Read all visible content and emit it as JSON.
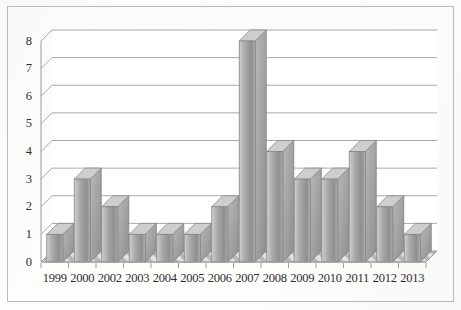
{
  "chart_data": {
    "type": "bar",
    "title": "",
    "subtitle": "",
    "xlabel": "",
    "ylabel": "",
    "categories": [
      "1999",
      "2000",
      "2002",
      "2003",
      "2004",
      "2005",
      "2006",
      "2007",
      "2008",
      "2009",
      "2010",
      "2011",
      "2012",
      "2013"
    ],
    "values": [
      1,
      3,
      2,
      1,
      1,
      1,
      2,
      8,
      4,
      3,
      3,
      4,
      2,
      1
    ],
    "ylim": [
      0,
      8
    ],
    "ytick_labels": [
      "0",
      "1",
      "2",
      "3",
      "4",
      "5",
      "6",
      "7",
      "8"
    ],
    "ytick_values": [
      0,
      1,
      2,
      3,
      4,
      5,
      6,
      7,
      8
    ],
    "grid": true,
    "grid_axis": "y",
    "legend": null,
    "legend_position": "none",
    "annotations": [],
    "style": "3d-column",
    "series": [
      {
        "name": "",
        "values": [
          1,
          3,
          2,
          1,
          1,
          1,
          2,
          8,
          4,
          3,
          3,
          4,
          2,
          1
        ]
      }
    ],
    "colors": {
      "bar_light": "#d2d2d2",
      "bar_mid": "#a6a6a6",
      "bar_dark": "#8f8f8f",
      "bar_top": "#cfcfcf",
      "gridline": "#a9a9a9",
      "axis": "#9a9a9a",
      "border": "#b9b9b9",
      "text": "#2e2e2e",
      "background": "#fdfdfc",
      "floor": "#d9d9d9"
    }
  }
}
